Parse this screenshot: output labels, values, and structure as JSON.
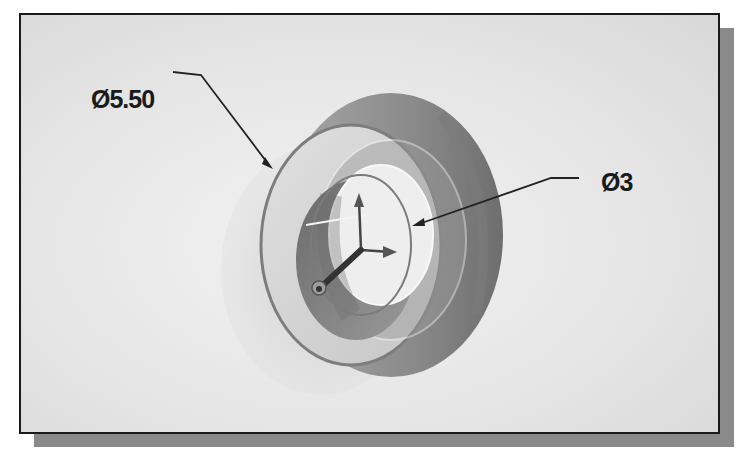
{
  "figure": {
    "top_caption_cut": "",
    "dimensions": [
      {
        "id": "outer",
        "symbol": "Ø",
        "value": "5.50",
        "label": "Ø5.50"
      },
      {
        "id": "inner",
        "symbol": "Ø",
        "value": "3",
        "label": "Ø3"
      }
    ],
    "model": {
      "type": "revolved cylindrical part (flange with bore)",
      "colors": {
        "background": "#e6e6e6",
        "outer_face": "#d4d4d4",
        "outer_rim": "#8c8c8c",
        "bore_dark": "#7a7a7a",
        "bore_light": "#efefef",
        "edge_highlight": "#f6f6f6",
        "frame_border": "#1a1a1a",
        "shadow": "#8a8a8a"
      },
      "triad": [
        "x-axis",
        "y-axis",
        "z-axis"
      ]
    }
  }
}
